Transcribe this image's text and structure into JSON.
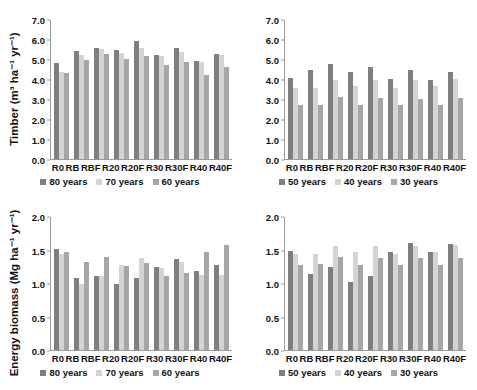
{
  "figure": {
    "title": "",
    "panels": [
      "timber-80-70-60",
      "timber-50-40-30",
      "energy-80-70-60",
      "energy-50-40-30"
    ]
  },
  "axis_labels": {
    "timber": "Timber (m³ ha⁻¹ yr⁻¹)",
    "energy": "Energy biomass (Mg ha⁻¹ yr⁻¹)"
  },
  "ticks": {
    "timber": [
      "7.0",
      "6.0",
      "5.0",
      "4.0",
      "3.0",
      "2.0",
      "1.0",
      "0.0"
    ],
    "energy": [
      "2.0",
      "1.5",
      "1.0",
      "0.5",
      "0.0"
    ]
  },
  "categories": [
    "R0",
    "RB",
    "RBF",
    "R20",
    "R20F",
    "R30",
    "R30F",
    "R40",
    "R40F"
  ],
  "legends": {
    "long_rotation": [
      "80 years",
      "70 years",
      "60 years"
    ],
    "short_rotation": [
      "50 years",
      "40 years",
      "30 years"
    ]
  },
  "colors": {
    "series1": "#7f7f7f",
    "series2": "#d4d4d4",
    "series3": "#a6a6a6",
    "axis": "#9a9a9a",
    "text": "#111111",
    "background": "#ffffff"
  },
  "chart_data": [
    {
      "type": "bar",
      "id": "timber-80-70-60",
      "title": "",
      "xlabel": "",
      "ylabel": "Timber (m³ ha⁻¹ yr⁻¹)",
      "ylim": [
        0.0,
        7.0
      ],
      "ytick_step": 1.0,
      "grid": false,
      "legend_position": "bottom",
      "categories": [
        "R0",
        "RB",
        "RBF",
        "R20",
        "R20F",
        "R30",
        "R30F",
        "R40",
        "R40F"
      ],
      "series": [
        {
          "name": "80 years",
          "color": "#7f7f7f",
          "values": [
            4.85,
            5.45,
            5.6,
            5.5,
            5.95,
            5.25,
            5.6,
            4.95,
            5.3
          ]
        },
        {
          "name": "70 years",
          "color": "#d4d4d4",
          "values": [
            4.4,
            5.25,
            5.55,
            5.35,
            5.6,
            5.2,
            5.4,
            4.9,
            5.25
          ]
        },
        {
          "name": "60 years",
          "color": "#a6a6a6",
          "values": [
            4.35,
            5.0,
            5.3,
            5.05,
            5.2,
            4.75,
            4.9,
            4.25,
            4.65
          ]
        }
      ]
    },
    {
      "type": "bar",
      "id": "timber-50-40-30",
      "title": "",
      "xlabel": "",
      "ylabel": "Timber (m³ ha⁻¹ yr⁻¹)",
      "ylim": [
        0.0,
        7.0
      ],
      "ytick_step": 1.0,
      "grid": false,
      "legend_position": "bottom",
      "categories": [
        "R0",
        "RB",
        "RBF",
        "R20",
        "R20F",
        "R30",
        "R30F",
        "R40",
        "R40F"
      ],
      "series": [
        {
          "name": "50 years",
          "color": "#7f7f7f",
          "values": [
            4.1,
            4.5,
            4.8,
            4.4,
            4.65,
            4.05,
            4.5,
            4.0,
            4.4
          ]
        },
        {
          "name": "40 years",
          "color": "#d4d4d4",
          "values": [
            3.6,
            3.6,
            4.0,
            3.7,
            4.0,
            3.6,
            4.0,
            3.7,
            4.05
          ]
        },
        {
          "name": "30 years",
          "color": "#a6a6a6",
          "values": [
            2.7,
            2.7,
            3.1,
            2.7,
            3.05,
            2.7,
            3.0,
            2.7,
            3.05
          ]
        }
      ]
    },
    {
      "type": "bar",
      "id": "energy-80-70-60",
      "title": "",
      "xlabel": "",
      "ylabel": "Energy biomass (Mg ha⁻¹ yr⁻¹)",
      "ylim": [
        0.0,
        2.0
      ],
      "ytick_step": 0.5,
      "grid": false,
      "legend_position": "bottom",
      "categories": [
        "R0",
        "RB",
        "RBF",
        "R20",
        "R20F",
        "R30",
        "R30F",
        "R40",
        "R40F"
      ],
      "series": [
        {
          "name": "80 years",
          "color": "#7f7f7f",
          "values": [
            1.52,
            1.08,
            1.12,
            1.0,
            1.08,
            1.25,
            1.37,
            1.19,
            1.28
          ]
        },
        {
          "name": "70 years",
          "color": "#d4d4d4",
          "values": [
            1.44,
            1.0,
            1.12,
            1.28,
            1.38,
            1.24,
            1.33,
            1.13,
            1.13
          ]
        },
        {
          "name": "60 years",
          "color": "#a6a6a6",
          "values": [
            1.48,
            1.32,
            1.4,
            1.26,
            1.31,
            1.11,
            1.16,
            1.47,
            1.58
          ]
        }
      ]
    },
    {
      "type": "bar",
      "id": "energy-50-40-30",
      "title": "",
      "xlabel": "",
      "ylabel": "Energy biomass (Mg ha⁻¹ yr⁻¹)",
      "ylim": [
        0.0,
        2.0
      ],
      "ytick_step": 0.5,
      "grid": false,
      "legend_position": "bottom",
      "categories": [
        "R0",
        "RB",
        "RBF",
        "R20",
        "R20F",
        "R30",
        "R30F",
        "R40",
        "R40F"
      ],
      "series": [
        {
          "name": "50 years",
          "color": "#7f7f7f",
          "values": [
            1.49,
            1.15,
            1.25,
            1.02,
            1.12,
            1.48,
            1.61,
            1.47,
            1.59
          ]
        },
        {
          "name": "40 years",
          "color": "#d4d4d4",
          "values": [
            1.45,
            1.45,
            1.56,
            1.48,
            1.56,
            1.44,
            1.56,
            1.47,
            1.58
          ]
        },
        {
          "name": "30 years",
          "color": "#a6a6a6",
          "values": [
            1.28,
            1.29,
            1.4,
            1.28,
            1.39,
            1.28,
            1.38,
            1.28,
            1.38
          ]
        }
      ]
    }
  ]
}
